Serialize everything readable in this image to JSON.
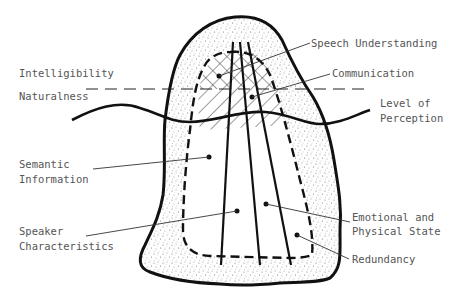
{
  "diagram": {
    "labels": {
      "intelligibility": "Intelligibility",
      "naturalness": "Naturalness",
      "speech_understanding": "Speech Understanding",
      "communication": "Communication",
      "level_of": "Level of",
      "perception": "Perception",
      "semantic": "Semantic",
      "information": "Information",
      "speaker": "Speaker",
      "characteristics": "Characteristics",
      "emotional_and": "Emotional and",
      "physical_state": "Physical State",
      "redundancy": "Redundancy"
    },
    "colors": {
      "stroke": "#111111",
      "text": "#555555",
      "stipple": "#777777"
    }
  }
}
